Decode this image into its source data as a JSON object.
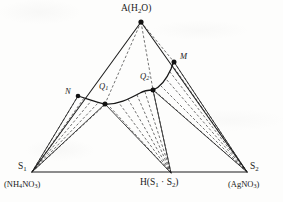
{
  "diagram": {
    "type": "ternary-phase-diagram",
    "title": "",
    "ink_color": "#1d1d1d",
    "background_color": "#fdfdfc",
    "vertices": [
      {
        "id": "A",
        "label": "A(H",
        "label_sub": "2",
        "label_tail": "O)",
        "full_label": "A(H2O)",
        "x": 141,
        "y": 22,
        "label_x": 121,
        "label_y": 4
      },
      {
        "id": "S1",
        "label": "S",
        "label_sub": "1",
        "full_label": "S1",
        "x": 32,
        "y": 172,
        "label_x": 18,
        "label_y": 162
      },
      {
        "id": "S2",
        "label": "S",
        "label_sub": "2",
        "full_label": "S2",
        "x": 247,
        "y": 172,
        "label_x": 250,
        "label_y": 162
      },
      {
        "id": "H",
        "label": "H(S",
        "label_sub": "1",
        "label_mid": " · S",
        "label_sub2": "2",
        "label_tail": ")",
        "full_label": "H(S1 · S2)",
        "x": 171,
        "y": 173,
        "label_x": 140,
        "label_y": 178
      }
    ],
    "vertex_formulas": [
      {
        "id": "S1-formula",
        "prefix": "(NH",
        "sub1": "4",
        "mid": "NO",
        "sub2": "3",
        "suffix": ")",
        "full_label": "(NH4NO3)",
        "x": 4,
        "y": 180
      },
      {
        "id": "S2-formula",
        "prefix": "(AgNO",
        "sub1": "3",
        "suffix": ")",
        "full_label": "(AgNO3)",
        "x": 228,
        "y": 180
      }
    ],
    "interior_points": [
      {
        "id": "N",
        "label": "N",
        "x": 78,
        "y": 96,
        "label_x": 65,
        "label_y": 87
      },
      {
        "id": "Q1",
        "label": "Q",
        "label_sub": "1",
        "full_label": "Q1",
        "x": 105,
        "y": 104,
        "label_x": 99,
        "label_y": 82
      },
      {
        "id": "Q2",
        "label": "Q",
        "label_sub": "2",
        "full_label": "Q2",
        "x": 153,
        "y": 90,
        "label_x": 140,
        "label_y": 72
      },
      {
        "id": "M",
        "label": "M",
        "x": 174,
        "y": 62,
        "label_x": 180,
        "label_y": 52
      }
    ],
    "solid_edges": [
      {
        "name": "edge-A-S1",
        "from": "A",
        "to": "S1"
      },
      {
        "name": "edge-A-S2",
        "from": "A",
        "to": "S2"
      },
      {
        "name": "baseline-S1-S2",
        "from": "S1",
        "to": "S2"
      },
      {
        "name": "tie-S1-N",
        "from": "S1",
        "to": "N"
      },
      {
        "name": "tie-S1-Q1",
        "from": "S1",
        "to": "Q1"
      },
      {
        "name": "tie-H-Q1",
        "from": "H",
        "to": "Q1"
      },
      {
        "name": "tie-H-Q2",
        "from": "H",
        "to": "Q2"
      },
      {
        "name": "tie-S2-Q2",
        "from": "S2",
        "to": "Q2"
      },
      {
        "name": "tie-S2-M",
        "from": "S2",
        "to": "M"
      }
    ],
    "solid_curve": {
      "name": "solubility-curve",
      "points": [
        "N",
        "Q1",
        "Q2",
        "M"
      ],
      "description": "solubility isotherm through N, Q1, Q2, M"
    },
    "dashed_fans": [
      {
        "name": "fan-from-S1",
        "origin": "S1",
        "count": 5
      },
      {
        "name": "fan-from-H",
        "origin": "H",
        "count": 6
      },
      {
        "name": "fan-from-S2",
        "origin": "S2",
        "count": 6
      },
      {
        "name": "fan-from-A",
        "origin": "A",
        "count": 3
      }
    ]
  }
}
